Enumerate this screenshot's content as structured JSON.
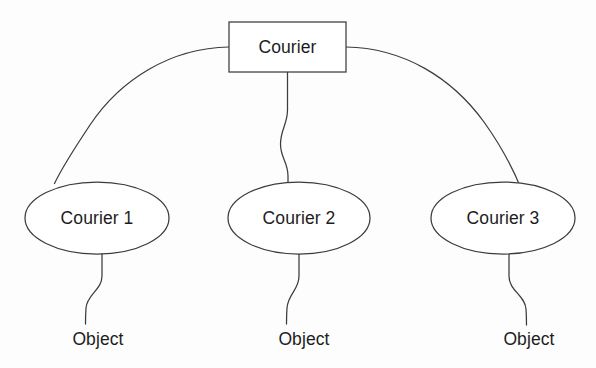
{
  "diagram": {
    "background_color": "#fdfdfd",
    "stroke_color": "#3c3c3c",
    "text_color": "#1d1d1d",
    "root": {
      "label": "Courier",
      "shape": "rectangle",
      "x": 229,
      "y": 22,
      "width": 117,
      "height": 50,
      "center_x": 287.5,
      "center_y": 47
    },
    "branches": [
      {
        "label": "Courier 1",
        "shape": "ellipse",
        "center_x": 97,
        "center_y": 218,
        "rx": 72,
        "ry": 36,
        "leaf": {
          "label": "Object",
          "center_x": 98,
          "baseline_y": 345
        }
      },
      {
        "label": "Courier 2",
        "shape": "ellipse",
        "center_x": 299,
        "center_y": 218,
        "rx": 71,
        "ry": 36,
        "leaf": {
          "label": "Object",
          "center_x": 304,
          "baseline_y": 345
        }
      },
      {
        "label": "Courier 3",
        "shape": "ellipse",
        "center_x": 503,
        "center_y": 218,
        "rx": 72,
        "ry": 36,
        "leaf": {
          "label": "Object",
          "center_x": 529,
          "baseline_y": 345
        }
      }
    ],
    "connectors": [
      {
        "name": "root-to-courier-1",
        "from": "Courier",
        "to": "Courier 1",
        "style": "curved-arc"
      },
      {
        "name": "root-to-courier-2",
        "from": "Courier",
        "to": "Courier 2",
        "style": "s-curve-vertical"
      },
      {
        "name": "root-to-courier-3",
        "from": "Courier",
        "to": "Courier 3",
        "style": "curved-arc"
      },
      {
        "name": "courier-1-to-object",
        "from": "Courier 1",
        "to": "Object",
        "style": "s-curve-vertical"
      },
      {
        "name": "courier-2-to-object",
        "from": "Courier 2",
        "to": "Object",
        "style": "s-curve-vertical"
      },
      {
        "name": "courier-3-to-object",
        "from": "Courier 3",
        "to": "Object",
        "style": "s-curve-vertical"
      }
    ]
  }
}
